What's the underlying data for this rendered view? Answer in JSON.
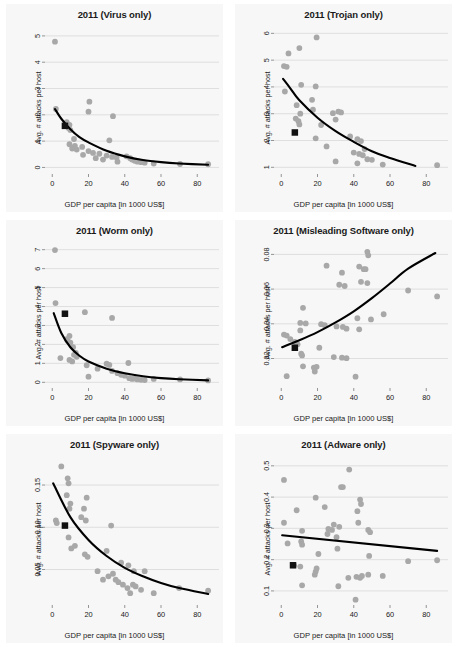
{
  "figure": {
    "axis_labels": {
      "x": "GDP per capita [in 1000 US$]",
      "y": "Avg. # attacks per host"
    },
    "colors": {
      "point": "#a8a8a8",
      "marker": "#111111",
      "trend": "#000000",
      "panel_background": "#f7f7f7",
      "grid": "#d4d4d4"
    }
  },
  "chart_data": [
    {
      "type": "scatter",
      "title": "2011 (Virus only)",
      "xlabel": "GDP per capita [in 1000 US$]",
      "ylabel": "Avg. # attacks per host",
      "xlim": [
        -4,
        92
      ],
      "ylim": [
        -0.25,
        5.3
      ],
      "xticks": [
        0,
        20,
        40,
        60,
        80
      ],
      "yticks": [
        0,
        1,
        2,
        3,
        4,
        5
      ],
      "grid": true,
      "legend": "none",
      "points": [
        [
          1.5,
          4.78
        ],
        [
          20.5,
          2.5
        ],
        [
          20.0,
          2.12
        ],
        [
          33.5,
          1.95
        ],
        [
          2.0,
          2.22
        ],
        [
          8.0,
          1.72
        ],
        [
          9.5,
          1.62
        ],
        [
          9.0,
          1.5
        ],
        [
          10.0,
          1.42
        ],
        [
          12.0,
          1.08
        ],
        [
          31.5,
          1.03
        ],
        [
          9.5,
          0.88
        ],
        [
          12.5,
          0.82
        ],
        [
          16.5,
          0.78
        ],
        [
          11.0,
          0.72
        ],
        [
          13.5,
          0.68
        ],
        [
          20.0,
          0.62
        ],
        [
          22.5,
          0.55
        ],
        [
          26.0,
          0.52
        ],
        [
          17.0,
          0.48
        ],
        [
          30.0,
          0.45
        ],
        [
          33.0,
          0.4
        ],
        [
          35.5,
          0.38
        ],
        [
          41.0,
          0.42
        ],
        [
          43.0,
          0.35
        ],
        [
          44.0,
          0.3
        ],
        [
          45.5,
          0.25
        ],
        [
          47.0,
          0.22
        ],
        [
          49.0,
          0.2
        ],
        [
          51.0,
          0.18
        ],
        [
          56.0,
          0.15
        ],
        [
          70.5,
          0.13
        ],
        [
          86.0,
          0.12
        ],
        [
          28.0,
          0.3
        ],
        [
          36.0,
          0.22
        ],
        [
          24.0,
          0.35
        ]
      ],
      "highlight_marker": [
        7.0,
        1.58
      ],
      "trend": {
        "shape": "exponential-decay",
        "points": [
          [
            1.5,
            2.22
          ],
          [
            5,
            1.85
          ],
          [
            10,
            1.45
          ],
          [
            15,
            1.15
          ],
          [
            20,
            0.95
          ],
          [
            30,
            0.63
          ],
          [
            40,
            0.42
          ],
          [
            50,
            0.28
          ],
          [
            60,
            0.2
          ],
          [
            70,
            0.15
          ],
          [
            86,
            0.1
          ]
        ]
      }
    },
    {
      "type": "scatter",
      "title": "2011 (Trojan only)",
      "xlabel": "GDP per capita [in 1000 US$]",
      "ylabel": "Avg. # attacks per host",
      "xlim": [
        -4,
        92
      ],
      "ylim": [
        0.75,
        6.2
      ],
      "xticks": [
        0,
        20,
        40,
        60,
        80
      ],
      "yticks": [
        1,
        2,
        3,
        4,
        5,
        6
      ],
      "grid": true,
      "legend": "none",
      "points": [
        [
          19.5,
          5.85
        ],
        [
          10.0,
          5.45
        ],
        [
          4.0,
          5.25
        ],
        [
          1.5,
          4.78
        ],
        [
          3.0,
          4.75
        ],
        [
          11.0,
          4.08
        ],
        [
          19.0,
          4.02
        ],
        [
          2.0,
          3.83
        ],
        [
          17.0,
          3.52
        ],
        [
          8.5,
          3.32
        ],
        [
          17.5,
          3.15
        ],
        [
          31.5,
          3.08
        ],
        [
          28.5,
          3.02
        ],
        [
          33.0,
          3.05
        ],
        [
          10.5,
          3.0
        ],
        [
          8.0,
          2.82
        ],
        [
          9.5,
          2.72
        ],
        [
          30.0,
          2.78
        ],
        [
          22.0,
          2.58
        ],
        [
          10.0,
          2.6
        ],
        [
          19.0,
          2.08
        ],
        [
          38.0,
          2.15
        ],
        [
          42.0,
          2.05
        ],
        [
          44.0,
          1.98
        ],
        [
          25.0,
          1.78
        ],
        [
          46.0,
          1.68
        ],
        [
          40.0,
          1.55
        ],
        [
          43.0,
          1.5
        ],
        [
          45.0,
          1.45
        ],
        [
          30.0,
          1.22
        ],
        [
          47.5,
          1.3
        ],
        [
          50.0,
          1.28
        ],
        [
          42.0,
          1.15
        ],
        [
          56.0,
          1.1
        ],
        [
          86.0,
          1.08
        ]
      ],
      "highlight_marker": [
        7.5,
        2.3
      ],
      "trend": {
        "shape": "exponential-decay",
        "points": [
          [
            1.0,
            4.3
          ],
          [
            5,
            3.95
          ],
          [
            10,
            3.5
          ],
          [
            20,
            2.85
          ],
          [
            30,
            2.35
          ],
          [
            40,
            1.95
          ],
          [
            50,
            1.6
          ],
          [
            60,
            1.35
          ],
          [
            74,
            1.05
          ]
        ]
      }
    },
    {
      "type": "scatter",
      "title": "2011 (Worm only)",
      "xlabel": "GDP per capita [in 1000 US$]",
      "ylabel": "Avg. # attacks per host",
      "xlim": [
        -4,
        92
      ],
      "ylim": [
        -0.3,
        7.3
      ],
      "xticks": [
        0,
        20,
        40,
        60,
        80
      ],
      "yticks": [
        0,
        1,
        2,
        3,
        4,
        5,
        6,
        7
      ],
      "grid": true,
      "legend": "none",
      "points": [
        [
          1.5,
          6.98
        ],
        [
          1.8,
          4.18
        ],
        [
          18.0,
          3.7
        ],
        [
          33.0,
          3.4
        ],
        [
          9.5,
          2.45
        ],
        [
          8.0,
          2.28
        ],
        [
          8.5,
          2.2
        ],
        [
          10.0,
          2.1
        ],
        [
          11.5,
          1.85
        ],
        [
          13.0,
          1.55
        ],
        [
          12.0,
          1.45
        ],
        [
          13.5,
          1.35
        ],
        [
          4.5,
          1.28
        ],
        [
          9.5,
          1.18
        ],
        [
          11.0,
          1.1
        ],
        [
          19.0,
          0.9
        ],
        [
          42.0,
          1.02
        ],
        [
          30.0,
          0.98
        ],
        [
          31.5,
          0.92
        ],
        [
          20.0,
          0.3
        ],
        [
          33.0,
          0.6
        ],
        [
          36.0,
          0.48
        ],
        [
          38.0,
          0.4
        ],
        [
          40.0,
          0.35
        ],
        [
          42.5,
          0.22
        ],
        [
          44.0,
          0.18
        ],
        [
          45.5,
          0.2
        ],
        [
          47.0,
          0.15
        ],
        [
          49.0,
          0.13
        ],
        [
          51.0,
          0.12
        ],
        [
          56.0,
          0.18
        ],
        [
          70.5,
          0.15
        ],
        [
          86.0,
          0.1
        ],
        [
          25.0,
          0.72
        ]
      ],
      "highlight_marker": [
        7.0,
        3.62
      ],
      "trend": {
        "shape": "exponential-decay",
        "points": [
          [
            0.8,
            3.65
          ],
          [
            5,
            2.6
          ],
          [
            10,
            1.85
          ],
          [
            15,
            1.4
          ],
          [
            20,
            1.1
          ],
          [
            30,
            0.72
          ],
          [
            40,
            0.48
          ],
          [
            50,
            0.32
          ],
          [
            60,
            0.22
          ],
          [
            70,
            0.16
          ],
          [
            86,
            0.1
          ]
        ]
      }
    },
    {
      "type": "scatter",
      "title": "2011 (Misleading Software only)",
      "xlabel": "GDP per capita [in 1000 US$]",
      "ylabel": "Avg. # attacks per host",
      "xlim": [
        -4,
        92
      ],
      "ylim": [
        0.003,
        0.086
      ],
      "xticks": [
        0,
        20,
        40,
        60,
        80
      ],
      "yticks": [
        0.02,
        0.04,
        0.06,
        0.08
      ],
      "ytick_labels": [
        "0.02",
        "0.04",
        "0.06",
        "0.08"
      ],
      "grid": true,
      "legend": "none",
      "points": [
        [
          47.5,
          0.0815
        ],
        [
          48.0,
          0.0795
        ],
        [
          25.0,
          0.0735
        ],
        [
          43.0,
          0.073
        ],
        [
          45.5,
          0.0715
        ],
        [
          46.5,
          0.0715
        ],
        [
          33.5,
          0.0695
        ],
        [
          47.5,
          0.0635
        ],
        [
          32.0,
          0.0625
        ],
        [
          35.0,
          0.0618
        ],
        [
          44.0,
          0.0642
        ],
        [
          70.0,
          0.0592
        ],
        [
          86.0,
          0.0558
        ],
        [
          12.0,
          0.0492
        ],
        [
          56.5,
          0.0455
        ],
        [
          42.0,
          0.0432
        ],
        [
          10.5,
          0.0405
        ],
        [
          13.5,
          0.0402
        ],
        [
          22.0,
          0.0398
        ],
        [
          24.0,
          0.0392
        ],
        [
          49.5,
          0.0425
        ],
        [
          30.5,
          0.0385
        ],
        [
          36.0,
          0.0372
        ],
        [
          34.0,
          0.0382
        ],
        [
          43.0,
          0.0368
        ],
        [
          10.5,
          0.0362
        ],
        [
          1.5,
          0.0338
        ],
        [
          3.0,
          0.0332
        ],
        [
          5.0,
          0.0312
        ],
        [
          7.5,
          0.0295
        ],
        [
          9.0,
          0.0282
        ],
        [
          21.0,
          0.0262
        ],
        [
          11.0,
          0.0228
        ],
        [
          11.5,
          0.0218
        ],
        [
          29.0,
          0.0208
        ],
        [
          33.5,
          0.0205
        ],
        [
          36.0,
          0.0202
        ],
        [
          12.0,
          0.0155
        ],
        [
          18.0,
          0.0148
        ],
        [
          19.5,
          0.0152
        ],
        [
          18.5,
          0.0125
        ],
        [
          3.0,
          0.0098
        ],
        [
          41.0,
          0.0095
        ]
      ],
      "highlight_marker": [
        7.5,
        0.0262
      ],
      "trend": {
        "shape": "exponential-growth",
        "points": [
          [
            0.5,
            0.0265
          ],
          [
            10,
            0.0305
          ],
          [
            20,
            0.0352
          ],
          [
            30,
            0.0408
          ],
          [
            40,
            0.0472
          ],
          [
            50,
            0.0548
          ],
          [
            60,
            0.0632
          ],
          [
            70,
            0.0718
          ],
          [
            85,
            0.0808
          ]
        ]
      }
    },
    {
      "type": "scatter",
      "title": "2011 (Spyware only)",
      "xlabel": "GDP per capita [in 1000 US$]",
      "ylabel": "Avg. # attacks per host",
      "xlim": [
        -4,
        92
      ],
      "ylim": [
        0.008,
        0.182
      ],
      "xticks": [
        0,
        20,
        40,
        60,
        80
      ],
      "yticks": [
        0.05,
        0.1,
        0.15
      ],
      "ytick_labels": [
        "0.05",
        "0.10",
        "0.15"
      ],
      "grid": true,
      "legend": "none",
      "points": [
        [
          5.0,
          0.172
        ],
        [
          8.5,
          0.158
        ],
        [
          9.0,
          0.152
        ],
        [
          8.0,
          0.138
        ],
        [
          19.0,
          0.135
        ],
        [
          10.0,
          0.128
        ],
        [
          9.5,
          0.122
        ],
        [
          17.5,
          0.122
        ],
        [
          2.0,
          0.108
        ],
        [
          2.5,
          0.105
        ],
        [
          18.5,
          0.108
        ],
        [
          16.0,
          0.112
        ],
        [
          32.5,
          0.102
        ],
        [
          9.0,
          0.088
        ],
        [
          10.5,
          0.075
        ],
        [
          12.5,
          0.078
        ],
        [
          18.0,
          0.068
        ],
        [
          19.5,
          0.065
        ],
        [
          30.0,
          0.072
        ],
        [
          38.0,
          0.058
        ],
        [
          25.0,
          0.048
        ],
        [
          42.0,
          0.055
        ],
        [
          45.0,
          0.048
        ],
        [
          51.0,
          0.048
        ],
        [
          28.0,
          0.038
        ],
        [
          31.0,
          0.042
        ],
        [
          33.5,
          0.045
        ],
        [
          35.0,
          0.038
        ],
        [
          36.5,
          0.035
        ],
        [
          39.0,
          0.032
        ],
        [
          41.5,
          0.028
        ],
        [
          43.0,
          0.022
        ],
        [
          44.5,
          0.032
        ],
        [
          46.0,
          0.03
        ],
        [
          49.0,
          0.026
        ],
        [
          56.0,
          0.022
        ],
        [
          70.0,
          0.028
        ],
        [
          86.0,
          0.025
        ]
      ],
      "highlight_marker": [
        7.0,
        0.102
      ],
      "trend": {
        "shape": "exponential-decay",
        "points": [
          [
            0.5,
            0.152
          ],
          [
            10,
            0.112
          ],
          [
            20,
            0.085
          ],
          [
            30,
            0.066
          ],
          [
            40,
            0.052
          ],
          [
            50,
            0.042
          ],
          [
            60,
            0.034
          ],
          [
            70,
            0.028
          ],
          [
            86,
            0.021
          ]
        ]
      }
    },
    {
      "type": "scatter",
      "title": "2011 (Adware only)",
      "xlabel": "GDP per capita [in 1000 US$]",
      "ylabel": "Avg. # attacks per host",
      "xlim": [
        -4,
        92
      ],
      "ylim": [
        0.055,
        0.525
      ],
      "xticks": [
        0,
        20,
        40,
        60,
        80
      ],
      "yticks": [
        0.1,
        0.2,
        0.3,
        0.4,
        0.5
      ],
      "ytick_labels": [
        "0.1",
        "0.2",
        "0.3",
        "0.4",
        "0.5"
      ],
      "grid": true,
      "legend": "none",
      "points": [
        [
          37.5,
          0.488
        ],
        [
          1.5,
          0.455
        ],
        [
          33.0,
          0.432
        ],
        [
          34.0,
          0.432
        ],
        [
          19.0,
          0.398
        ],
        [
          43.5,
          0.392
        ],
        [
          44.0,
          0.378
        ],
        [
          8.5,
          0.358
        ],
        [
          24.0,
          0.368
        ],
        [
          42.0,
          0.355
        ],
        [
          1.5,
          0.318
        ],
        [
          29.0,
          0.312
        ],
        [
          32.0,
          0.305
        ],
        [
          42.5,
          0.318
        ],
        [
          26.0,
          0.298
        ],
        [
          28.0,
          0.295
        ],
        [
          11.5,
          0.292
        ],
        [
          48.0,
          0.295
        ],
        [
          49.0,
          0.288
        ],
        [
          25.5,
          0.282
        ],
        [
          30.5,
          0.272
        ],
        [
          3.5,
          0.252
        ],
        [
          11.0,
          0.258
        ],
        [
          11.5,
          0.248
        ],
        [
          31.0,
          0.235
        ],
        [
          20.5,
          0.218
        ],
        [
          48.5,
          0.212
        ],
        [
          70.0,
          0.195
        ],
        [
          86.0,
          0.198
        ],
        [
          7.0,
          0.182
        ],
        [
          10.5,
          0.178
        ],
        [
          19.5,
          0.172
        ],
        [
          19.0,
          0.162
        ],
        [
          18.5,
          0.152
        ],
        [
          48.0,
          0.152
        ],
        [
          56.0,
          0.148
        ],
        [
          41.5,
          0.145
        ],
        [
          43.5,
          0.142
        ],
        [
          44.5,
          0.148
        ],
        [
          37.0,
          0.142
        ],
        [
          11.5,
          0.118
        ],
        [
          31.5,
          0.115
        ],
        [
          41.0,
          0.072
        ]
      ],
      "highlight_marker": [
        6.5,
        0.182
      ],
      "trend": {
        "shape": "linear-slight-decline",
        "points": [
          [
            0.5,
            0.278
          ],
          [
            86,
            0.228
          ]
        ]
      }
    }
  ]
}
